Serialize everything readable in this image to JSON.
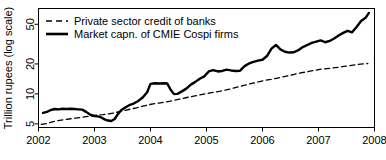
{
  "chart_data": {
    "type": "line",
    "title": "",
    "xlabel": "",
    "ylabel": "Trillion rupees (log scale)",
    "yscale": "log",
    "ylim": [
      4.6,
      72
    ],
    "xlim": [
      2002.0,
      2008.0
    ],
    "yticks": [
      5,
      10,
      20,
      50
    ],
    "ytick_labels": [
      "5",
      "10",
      "20",
      "50"
    ],
    "xticks": [
      2002,
      2003,
      2004,
      2005,
      2006,
      2007,
      2008
    ],
    "xtick_labels": [
      "2002",
      "2003",
      "2004",
      "2005",
      "2006",
      "2007",
      "2008"
    ],
    "grid": false,
    "legend_position": "top-left",
    "series": [
      {
        "name": "Private sector credit of banks",
        "style": "dashed",
        "color": "#000000",
        "x": [
          2002.05,
          2002.15,
          2002.25,
          2002.35,
          2002.45,
          2002.55,
          2002.65,
          2002.75,
          2002.85,
          2002.95,
          2003.05,
          2003.15,
          2003.25,
          2003.35,
          2003.45,
          2003.55,
          2003.65,
          2003.75,
          2003.85,
          2003.95,
          2004.05,
          2004.15,
          2004.25,
          2004.35,
          2004.45,
          2004.55,
          2004.65,
          2004.75,
          2004.85,
          2004.95,
          2005.05,
          2005.15,
          2005.25,
          2005.35,
          2005.45,
          2005.55,
          2005.65,
          2005.75,
          2005.85,
          2005.95,
          2006.05,
          2006.15,
          2006.25,
          2006.35,
          2006.45,
          2006.55,
          2006.65,
          2006.75,
          2006.85,
          2006.95,
          2007.05,
          2007.15,
          2007.25,
          2007.35,
          2007.45,
          2007.55,
          2007.65,
          2007.75,
          2007.88
        ],
        "y": [
          4.95,
          5.05,
          5.25,
          5.4,
          5.5,
          5.6,
          5.7,
          5.8,
          5.9,
          6.0,
          6.15,
          6.2,
          6.3,
          6.45,
          6.65,
          6.85,
          7.05,
          7.25,
          7.5,
          7.75,
          7.95,
          8.1,
          8.25,
          8.45,
          8.7,
          8.95,
          9.2,
          9.45,
          9.7,
          9.95,
          10.2,
          10.4,
          10.65,
          10.95,
          11.3,
          11.7,
          12.1,
          12.5,
          12.9,
          13.3,
          13.7,
          14.0,
          14.35,
          14.75,
          15.2,
          15.65,
          16.1,
          16.5,
          16.9,
          17.3,
          17.7,
          17.95,
          18.2,
          18.5,
          18.85,
          19.2,
          19.55,
          19.9,
          20.2
        ]
      },
      {
        "name": "Market capn. of CMIE Cospi firms",
        "style": "solid",
        "color": "#000000",
        "x": [
          2002.08,
          2002.15,
          2002.22,
          2002.29,
          2002.36,
          2002.43,
          2002.5,
          2002.57,
          2002.64,
          2002.71,
          2002.78,
          2002.85,
          2002.92,
          2003.0,
          2003.06,
          2003.12,
          2003.18,
          2003.24,
          2003.3,
          2003.36,
          2003.42,
          2003.48,
          2003.55,
          2003.62,
          2003.7,
          2003.78,
          2003.86,
          2003.94,
          2004.0,
          2004.08,
          2004.16,
          2004.24,
          2004.3,
          2004.36,
          2004.42,
          2004.48,
          2004.56,
          2004.64,
          2004.72,
          2004.8,
          2004.88,
          2004.96,
          2005.04,
          2005.12,
          2005.2,
          2005.28,
          2005.36,
          2005.44,
          2005.52,
          2005.6,
          2005.68,
          2005.76,
          2005.84,
          2005.92,
          2006.0,
          2006.08,
          2006.16,
          2006.24,
          2006.32,
          2006.4,
          2006.48,
          2006.56,
          2006.64,
          2006.72,
          2006.8,
          2006.88,
          2006.96,
          2007.04,
          2007.12,
          2007.2,
          2007.28,
          2007.36,
          2007.44,
          2007.52,
          2007.6,
          2007.68,
          2007.76,
          2007.84,
          2007.9
        ],
        "y": [
          6.45,
          6.6,
          6.9,
          7.05,
          7.0,
          7.1,
          7.05,
          7.1,
          7.05,
          7.0,
          6.95,
          6.6,
          6.2,
          6.0,
          5.95,
          5.8,
          5.55,
          5.4,
          5.35,
          5.6,
          6.3,
          6.9,
          7.3,
          7.7,
          8.0,
          8.5,
          9.2,
          10.4,
          12.6,
          12.8,
          12.7,
          12.8,
          12.7,
          11.0,
          9.95,
          10.0,
          10.6,
          11.3,
          12.4,
          13.2,
          14.2,
          15.0,
          16.8,
          17.3,
          16.8,
          17.0,
          17.5,
          17.2,
          17.0,
          17.1,
          19.0,
          20.2,
          21.0,
          21.6,
          22.0,
          24.0,
          28.5,
          31.0,
          28.0,
          26.5,
          26.0,
          26.2,
          27.5,
          29.5,
          31.0,
          32.5,
          33.5,
          34.5,
          33.0,
          34.0,
          36.0,
          38.5,
          41.0,
          43.0,
          41.5,
          47.0,
          54.0,
          58.0,
          65.0
        ]
      }
    ]
  },
  "legend": {
    "entries": [
      {
        "label": "Private sector credit of banks",
        "style": "dashed"
      },
      {
        "label": "Market capn. of CMIE Cospi firms",
        "style": "solid"
      }
    ]
  },
  "axes": {
    "ylabel": "Trillion rupees (log scale)"
  }
}
